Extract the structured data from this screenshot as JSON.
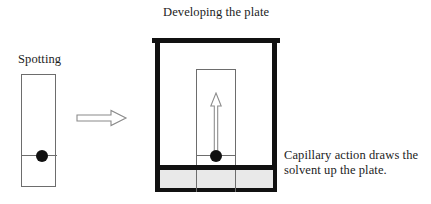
{
  "figure": {
    "title_right": "Developing the plate",
    "label_left": "Spotting",
    "caption_right": "Capillary action draws the solvent up the plate."
  },
  "colors": {
    "ink": "#111111",
    "thin_line": "#6d6d6d",
    "solvent_fill": "#e9e9e9",
    "background": "#ffffff"
  },
  "panels": {
    "spotting": {
      "label": "Spotting",
      "plate_name": "tlc-plate",
      "baseline_name": "origin-line",
      "spot_name": "sample-spot"
    },
    "developing": {
      "title": "Developing the plate",
      "chamber_name": "developing-chamber",
      "lid_name": "chamber-lid",
      "solvent_name": "solvent-pool",
      "plate_name": "tlc-plate",
      "arrow_name": "solvent-front-arrow",
      "spot_name": "sample-spot"
    }
  },
  "icons": {
    "transition_arrow": "right-arrow-icon",
    "solvent_arrow": "up-arrow-icon"
  }
}
